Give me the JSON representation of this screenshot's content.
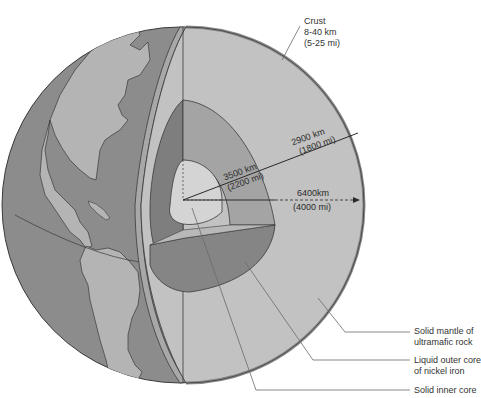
{
  "diagram": {
    "colors": {
      "background": "#ffffff",
      "ocean": "#8c8c8c",
      "land": "#b4b4b4",
      "crust": "#a8a8a8",
      "mantle": "#c2c2c2",
      "outer_core_dark": "#7e7e7e",
      "outer_core_light": "#9a9a9a",
      "inner_core": "#d4d4d4",
      "outline": "#3a3a3a",
      "leader": "#6a6a6a"
    },
    "labels": {
      "crust": {
        "title": "Crust",
        "line1": "8-40 km",
        "line2": "(5-25 mi)"
      },
      "mantle": {
        "line1": "Solid mantle of",
        "line2": "ultramafic rock"
      },
      "outer_core": {
        "line1": "Liquid outer core",
        "line2": "of nickel iron"
      },
      "inner_core": {
        "line1": "Solid inner core"
      }
    },
    "measurements": {
      "mantle_thickness": {
        "km": "2900 km",
        "mi": "(1800 mi)"
      },
      "core_radius": {
        "km": "3500 km",
        "mi": "(2200 mi)"
      },
      "earth_radius": {
        "km": "6400km",
        "mi": "(4000 mi)"
      }
    }
  }
}
